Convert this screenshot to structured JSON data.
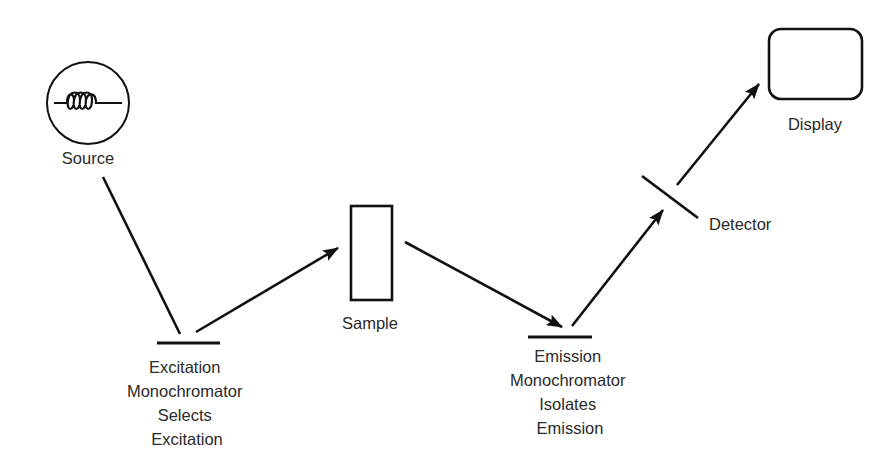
{
  "diagram": {
    "type": "spectrofluorometer-schematic",
    "colors": {
      "line": "#111111",
      "text": "#2a2a2a",
      "background": "#ffffff"
    },
    "nodes": {
      "source": {
        "label": "Source",
        "icon": "lamp-filament-coil-icon"
      },
      "excitation_monochromator": {
        "lines": [
          "Excitation",
          "Monochromator",
          "Selects",
          "Excitation"
        ]
      },
      "sample": {
        "label": "Sample",
        "icon": "cuvette-rectangle-icon"
      },
      "emission_monochromator": {
        "lines": [
          "Emission",
          "Monochromator",
          "Isolates",
          "Emission"
        ]
      },
      "detector": {
        "label": "Detector",
        "icon": "detector-plate-icon"
      },
      "display": {
        "label": "Display",
        "icon": "display-screen-icon"
      }
    },
    "edges": [
      {
        "from": "source",
        "to": "excitation_monochromator",
        "arrow": false
      },
      {
        "from": "excitation_monochromator",
        "to": "sample",
        "arrow": true
      },
      {
        "from": "sample",
        "to": "emission_monochromator",
        "arrow": true
      },
      {
        "from": "emission_monochromator",
        "to": "detector",
        "arrow": true
      },
      {
        "from": "detector",
        "to": "display",
        "arrow": true
      }
    ]
  }
}
